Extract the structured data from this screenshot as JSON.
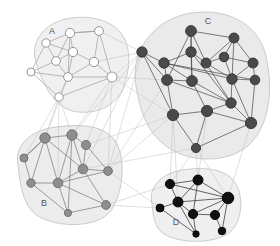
{
  "figure": {
    "background_color": "#ffffff",
    "width": 280,
    "height": 246
  },
  "chart_data": {
    "type": "scatter",
    "title": "",
    "xlabel": "",
    "ylabel": "",
    "grid": false,
    "legend_position": "none",
    "node_count": 45,
    "cluster_count": 4,
    "clusters": [
      {
        "id": "A",
        "label": "A",
        "label_x": 52,
        "label_y": 34,
        "node_color": "#ffffff",
        "node_stroke": "#8c8c8c",
        "edge_color": "#9a9a9a",
        "hull_fill": "#ededed",
        "node_count": 10,
        "hull": "M 36 62 C 30 44, 42 26, 62 20 C 84 14, 108 18, 120 32 C 132 46, 130 68, 124 86 C 118 104, 100 114, 78 112 C 54 110, 42 82, 36 62 Z",
        "nodes": [
          {
            "id": "a1",
            "x": 46,
            "y": 43,
            "r": 4.2
          },
          {
            "id": "a2",
            "x": 70,
            "y": 33,
            "r": 4.6
          },
          {
            "id": "a3",
            "x": 99,
            "y": 31,
            "r": 4.4
          },
          {
            "id": "a4",
            "x": 56,
            "y": 61,
            "r": 4.4
          },
          {
            "id": "a5",
            "x": 73,
            "y": 52,
            "r": 4.6
          },
          {
            "id": "a6",
            "x": 94,
            "y": 62,
            "r": 4.6
          },
          {
            "id": "a7",
            "x": 31,
            "y": 72,
            "r": 4.0
          },
          {
            "id": "a8",
            "x": 68,
            "y": 77,
            "r": 4.4
          },
          {
            "id": "a9",
            "x": 112,
            "y": 77,
            "r": 5.0
          },
          {
            "id": "a10",
            "x": 59,
            "y": 97,
            "r": 4.2
          }
        ],
        "edges": [
          [
            "a1",
            "a2"
          ],
          [
            "a1",
            "a4"
          ],
          [
            "a1",
            "a7"
          ],
          [
            "a2",
            "a5"
          ],
          [
            "a2",
            "a3"
          ],
          [
            "a2",
            "a4"
          ],
          [
            "a3",
            "a9"
          ],
          [
            "a3",
            "a6"
          ],
          [
            "a4",
            "a5"
          ],
          [
            "a4",
            "a8"
          ],
          [
            "a4",
            "a7"
          ],
          [
            "a5",
            "a6"
          ],
          [
            "a5",
            "a8"
          ],
          [
            "a6",
            "a9"
          ],
          [
            "a7",
            "a8"
          ],
          [
            "a7",
            "a10"
          ],
          [
            "a8",
            "a10"
          ],
          [
            "a8",
            "a9"
          ],
          [
            "a9",
            "a10"
          ],
          [
            "a2",
            "a8"
          ],
          [
            "a1",
            "a5"
          ],
          [
            "a3",
            "a2"
          ],
          [
            "a6",
            "a8"
          ]
        ]
      },
      {
        "id": "B",
        "label": "B",
        "label_x": 44,
        "label_y": 206,
        "node_color": "#8e8e8e",
        "node_stroke": "#6d6d6d",
        "edge_color": "#6f6f6f",
        "hull_fill": "#e9e9e9",
        "node_count": 10,
        "hull": "M 18 165 C 14 146, 30 130, 56 127 C 86 123, 110 127, 118 146 C 126 166, 122 196, 110 212 C 96 228, 58 228, 38 216 C 22 206, 20 182, 18 165 Z",
        "nodes": [
          {
            "id": "b1",
            "x": 45,
            "y": 138,
            "r": 5.2
          },
          {
            "id": "b2",
            "x": 72,
            "y": 135,
            "r": 5.2
          },
          {
            "id": "b3",
            "x": 86,
            "y": 145,
            "r": 4.6
          },
          {
            "id": "b4",
            "x": 24,
            "y": 158,
            "r": 4.0
          },
          {
            "id": "b5",
            "x": 83,
            "y": 169,
            "r": 4.8
          },
          {
            "id": "b6",
            "x": 108,
            "y": 171,
            "r": 4.4
          },
          {
            "id": "b7",
            "x": 31,
            "y": 183,
            "r": 4.2
          },
          {
            "id": "b8",
            "x": 58,
            "y": 183,
            "r": 4.8
          },
          {
            "id": "b9",
            "x": 68,
            "y": 213,
            "r": 3.6
          },
          {
            "id": "b10",
            "x": 106,
            "y": 205,
            "r": 4.4
          }
        ],
        "edges": [
          [
            "b1",
            "b2"
          ],
          [
            "b1",
            "b7"
          ],
          [
            "b1",
            "b4"
          ],
          [
            "b1",
            "b8"
          ],
          [
            "b2",
            "b3"
          ],
          [
            "b2",
            "b8"
          ],
          [
            "b2",
            "b5"
          ],
          [
            "b3",
            "b5"
          ],
          [
            "b4",
            "b7"
          ],
          [
            "b5",
            "b6"
          ],
          [
            "b5",
            "b8"
          ],
          [
            "b7",
            "b8"
          ],
          [
            "b7",
            "b9"
          ],
          [
            "b8",
            "b9"
          ],
          [
            "b8",
            "b6"
          ],
          [
            "b8",
            "b10"
          ],
          [
            "b9",
            "b10"
          ],
          [
            "b3",
            "b6"
          ],
          [
            "b4",
            "b1"
          ],
          [
            "b2",
            "b9"
          ],
          [
            "b5",
            "b10"
          ],
          [
            "b1",
            "b5"
          ]
        ]
      },
      {
        "id": "C",
        "label": "C",
        "label_x": 208,
        "label_y": 24,
        "node_color": "#4a4a4a",
        "node_stroke": "#333333",
        "edge_color": "#3d3d3d",
        "hull_fill": "#e6e6e6",
        "node_count": 16,
        "hull": "M 136 86 C 130 52, 152 22, 186 14 C 224 6, 258 22, 266 56 C 274 92, 268 124, 252 142 C 234 162, 196 164, 172 150 C 148 136, 140 112, 136 86 Z",
        "nodes": [
          {
            "id": "c1",
            "x": 191,
            "y": 31,
            "r": 5.4
          },
          {
            "id": "c2",
            "x": 234,
            "y": 38,
            "r": 5.0
          },
          {
            "id": "c3",
            "x": 142,
            "y": 52,
            "r": 5.2
          },
          {
            "id": "c4",
            "x": 191,
            "y": 52,
            "r": 5.2
          },
          {
            "id": "c5",
            "x": 206,
            "y": 63,
            "r": 5.0
          },
          {
            "id": "c6",
            "x": 224,
            "y": 57,
            "r": 4.8
          },
          {
            "id": "c7",
            "x": 164,
            "y": 63,
            "r": 5.2
          },
          {
            "id": "c8",
            "x": 253,
            "y": 63,
            "r": 5.0
          },
          {
            "id": "c9",
            "x": 167,
            "y": 80,
            "r": 5.4
          },
          {
            "id": "c10",
            "x": 192,
            "y": 81,
            "r": 5.4
          },
          {
            "id": "c11",
            "x": 232,
            "y": 79,
            "r": 5.2
          },
          {
            "id": "c12",
            "x": 255,
            "y": 80,
            "r": 4.8
          },
          {
            "id": "c13",
            "x": 231,
            "y": 103,
            "r": 5.2
          },
          {
            "id": "c14",
            "x": 173,
            "y": 115,
            "r": 5.6
          },
          {
            "id": "c15",
            "x": 207,
            "y": 111,
            "r": 5.6
          },
          {
            "id": "c16",
            "x": 251,
            "y": 123,
            "r": 5.6
          },
          {
            "id": "c17",
            "x": 196,
            "y": 148,
            "r": 4.6
          }
        ],
        "edges": [
          [
            "c1",
            "c2"
          ],
          [
            "c1",
            "c4"
          ],
          [
            "c1",
            "c5"
          ],
          [
            "c1",
            "c9"
          ],
          [
            "c2",
            "c5"
          ],
          [
            "c2",
            "c6"
          ],
          [
            "c2",
            "c11"
          ],
          [
            "c3",
            "c7"
          ],
          [
            "c3",
            "c9"
          ],
          [
            "c4",
            "c5"
          ],
          [
            "c4",
            "c7"
          ],
          [
            "c4",
            "c10"
          ],
          [
            "c5",
            "c6"
          ],
          [
            "c5",
            "c11"
          ],
          [
            "c5",
            "c13"
          ],
          [
            "c6",
            "c8"
          ],
          [
            "c6",
            "c11"
          ],
          [
            "c7",
            "c9"
          ],
          [
            "c7",
            "c10"
          ],
          [
            "c7",
            "c11"
          ],
          [
            "c7",
            "c12"
          ],
          [
            "c8",
            "c11"
          ],
          [
            "c8",
            "c12"
          ],
          [
            "c9",
            "c10"
          ],
          [
            "c9",
            "c13"
          ],
          [
            "c9",
            "c14"
          ],
          [
            "c10",
            "c13"
          ],
          [
            "c10",
            "c15"
          ],
          [
            "c11",
            "c12"
          ],
          [
            "c11",
            "c13"
          ],
          [
            "c11",
            "c16"
          ],
          [
            "c12",
            "c16"
          ],
          [
            "c13",
            "c16"
          ],
          [
            "c13",
            "c15"
          ],
          [
            "c14",
            "c15"
          ],
          [
            "c14",
            "c17"
          ],
          [
            "c15",
            "c16"
          ],
          [
            "c16",
            "c17"
          ],
          [
            "c1",
            "c10"
          ],
          [
            "c4",
            "c13"
          ],
          [
            "c3",
            "c14"
          ],
          [
            "c2",
            "c8"
          ],
          [
            "c15",
            "c17"
          ]
        ]
      },
      {
        "id": "D",
        "label": "D",
        "label_x": 176,
        "label_y": 225,
        "node_color": "#111111",
        "node_stroke": "#000000",
        "edge_color": "#1a1a1a",
        "hull_fill": "#ececec",
        "hull_count": 9,
        "node_count": 9,
        "hull": "M 152 204 C 148 188, 160 174, 182 170 C 208 166, 228 170, 236 184 C 244 198, 242 222, 230 232 C 216 244, 180 244, 164 234 C 154 228, 153 214, 152 204 Z",
        "nodes": [
          {
            "id": "d1",
            "x": 170,
            "y": 184,
            "r": 4.6
          },
          {
            "id": "d2",
            "x": 198,
            "y": 180,
            "r": 5.0
          },
          {
            "id": "d3",
            "x": 228,
            "y": 198,
            "r": 5.8
          },
          {
            "id": "d4",
            "x": 160,
            "y": 208,
            "r": 4.0
          },
          {
            "id": "d5",
            "x": 178,
            "y": 202,
            "r": 5.0
          },
          {
            "id": "d6",
            "x": 193,
            "y": 214,
            "r": 4.6
          },
          {
            "id": "d7",
            "x": 215,
            "y": 215,
            "r": 4.6
          },
          {
            "id": "d8",
            "x": 196,
            "y": 234,
            "r": 3.2
          },
          {
            "id": "d9",
            "x": 222,
            "y": 231,
            "r": 3.8
          }
        ],
        "edges": [
          [
            "d1",
            "d2"
          ],
          [
            "d1",
            "d3"
          ],
          [
            "d2",
            "d3"
          ],
          [
            "d2",
            "d5"
          ],
          [
            "d3",
            "d5"
          ],
          [
            "d3",
            "d6"
          ],
          [
            "d3",
            "d7"
          ],
          [
            "d4",
            "d5"
          ],
          [
            "d5",
            "d6"
          ],
          [
            "d5",
            "d8"
          ],
          [
            "d6",
            "d7"
          ],
          [
            "d7",
            "d9"
          ],
          [
            "d4",
            "d8"
          ],
          [
            "d1",
            "d5"
          ],
          [
            "d3",
            "d9"
          ],
          [
            "d2",
            "d6"
          ],
          [
            "d6",
            "d8"
          ]
        ]
      }
    ],
    "inter_cluster_edges": [
      [
        "a9",
        "c3"
      ],
      [
        "a9",
        "c14"
      ],
      [
        "a9",
        "b2"
      ],
      [
        "a10",
        "b1"
      ],
      [
        "a10",
        "b2"
      ],
      [
        "a8",
        "b1"
      ],
      [
        "a9",
        "b3"
      ],
      [
        "a10",
        "b8"
      ],
      [
        "a6",
        "c3"
      ],
      [
        "a3",
        "c3"
      ],
      [
        "b3",
        "c14"
      ],
      [
        "b6",
        "c14"
      ],
      [
        "b5",
        "c17"
      ],
      [
        "b6",
        "d4"
      ],
      [
        "b10",
        "d4"
      ],
      [
        "b6",
        "c3"
      ],
      [
        "c17",
        "d2"
      ],
      [
        "c17",
        "d1"
      ],
      [
        "c16",
        "d3"
      ],
      [
        "c14",
        "d1"
      ],
      [
        "c17",
        "d3"
      ],
      [
        "b10",
        "d1"
      ],
      [
        "a9",
        "b6"
      ],
      [
        "b2",
        "c3"
      ],
      [
        "c15",
        "d2"
      ],
      [
        "b5",
        "c3"
      ],
      [
        "a10",
        "b4"
      ],
      [
        "c14",
        "d5"
      ],
      [
        "b6",
        "c9"
      ],
      [
        "a9",
        "c9"
      ]
    ]
  }
}
